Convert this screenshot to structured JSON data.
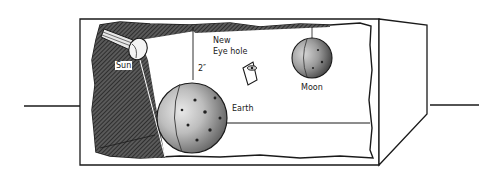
{
  "diagram": {
    "type": "model box illustration",
    "labels": {
      "sun": "Sun",
      "new_eye_hole_line1": "New",
      "new_eye_hole_line2": "Eye hole",
      "distance": "2″",
      "earth": "Earth",
      "moon": "Moon"
    },
    "colors": {
      "ink": "#1a1a1a",
      "background": "#ffffff",
      "shadow_hatch": "#3a3a3a"
    },
    "objects": [
      {
        "name": "sun",
        "kind": "flashlight"
      },
      {
        "name": "earth",
        "kind": "sphere"
      },
      {
        "name": "moon",
        "kind": "sphere"
      },
      {
        "name": "new-eye-hole",
        "kind": "eye-opening"
      },
      {
        "name": "box",
        "kind": "cardboard box with torn front"
      }
    ]
  }
}
